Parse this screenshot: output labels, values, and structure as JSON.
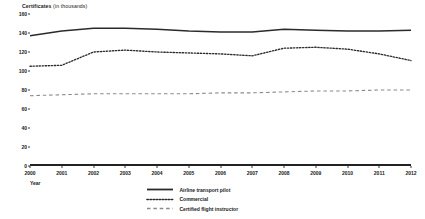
{
  "chart_data": {
    "type": "line",
    "title": "Certificates",
    "title_unit": "(in thousands)",
    "xlabel": "Year",
    "ylabel": "Certificates (in thousands)",
    "ylim": [
      0,
      160
    ],
    "yticks": [
      0,
      20,
      40,
      60,
      80,
      100,
      120,
      140,
      160
    ],
    "grid": false,
    "legend_position": "bottom-center",
    "categories": [
      2000,
      2001,
      2002,
      2003,
      2004,
      2005,
      2006,
      2007,
      2008,
      2009,
      2010,
      2011,
      2012
    ],
    "x": [
      "2000",
      "2001",
      "2002",
      "2003",
      "2004",
      "2005",
      "2006",
      "2007",
      "2008",
      "2009",
      "2010",
      "2011",
      "2012"
    ],
    "series": [
      {
        "name": "Airline transport pilot",
        "style": "solid",
        "color": "#2b2b2b",
        "values": [
          137,
          142,
          145,
          145,
          144,
          142,
          141,
          141,
          144,
          143,
          142,
          142,
          143
        ]
      },
      {
        "name": "Commercial",
        "style": "dotted",
        "color": "#2b2b2b",
        "values": [
          105,
          106,
          120,
          122,
          120,
          119,
          118,
          116,
          124,
          125,
          123,
          118,
          111
        ]
      },
      {
        "name": "Certified flight instructor",
        "style": "dashed",
        "color": "#8a8a8a",
        "values": [
          74,
          75,
          76,
          76,
          76,
          76,
          77,
          77,
          78,
          79,
          79,
          80,
          80
        ]
      }
    ]
  },
  "legend": {
    "items": [
      {
        "label": "Airline transport pilot"
      },
      {
        "label": "Commercial"
      },
      {
        "label": "Certified flight instructor"
      }
    ]
  }
}
